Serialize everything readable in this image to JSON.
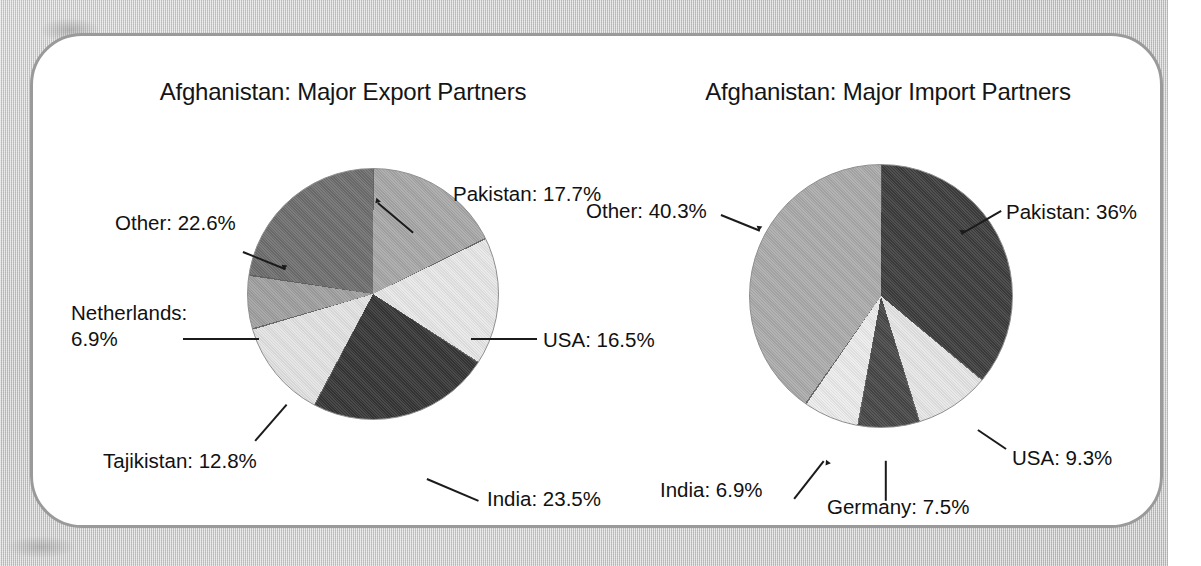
{
  "page": {
    "panel_border_color": "#9a9a9a",
    "background_color": "#c9c9c9"
  },
  "chart_data": [
    {
      "type": "pie",
      "id": "export",
      "title": "Afghanistan: Major Export Partners",
      "categories": [
        "Pakistan",
        "USA",
        "India",
        "Tajikistan",
        "Netherlands",
        "Other"
      ],
      "values": [
        17.7,
        16.5,
        23.5,
        12.8,
        6.9,
        22.6
      ],
      "labels": [
        "Pakistan: 17.7%",
        "USA: 16.5%",
        "India: 23.5%",
        "Tajikistan: 12.8%",
        "Netherlands: 6.9%",
        "Other: 22.6%"
      ],
      "colors": [
        "#a8a8a8",
        "#e8e8e8",
        "#363636",
        "#e3e3e3",
        "#a0a0a0",
        "#6e6e6e"
      ],
      "start_angle": 0,
      "direction": "clockwise",
      "legend": "none",
      "grid": false,
      "units": "percent"
    },
    {
      "type": "pie",
      "id": "import",
      "title": "Afghanistan: Major Import Partners",
      "categories": [
        "Pakistan",
        "USA",
        "Germany",
        "India",
        "Other"
      ],
      "values": [
        36,
        9.3,
        7.5,
        6.9,
        40.3
      ],
      "labels": [
        "Pakistan: 36%",
        "USA: 9.3%",
        "Germany: 7.5%",
        "India: 6.9%",
        "Other: 40.3%"
      ],
      "colors": [
        "#3d3d3d",
        "#e6e6e6",
        "#474747",
        "#ececec",
        "#ababab"
      ],
      "start_angle": 0,
      "direction": "clockwise",
      "legend": "none",
      "grid": false,
      "units": "percent"
    }
  ],
  "export_chart": {
    "title": "Afghanistan: Major Export Partners",
    "label_pakistan": "Pakistan: 17.7%",
    "label_usa": "USA: 16.5%",
    "label_india": "India: 23.5%",
    "label_tajikistan": "Tajikistan: 12.8%",
    "label_netherlands": "Netherlands: 6.9%",
    "label_other": "Other: 22.6%"
  },
  "import_chart": {
    "title": "Afghanistan: Major Import Partners",
    "label_pakistan": "Pakistan: 36%",
    "label_usa": "USA: 9.3%",
    "label_germany": "Germany: 7.5%",
    "label_india": "India: 6.9%",
    "label_other": "Other: 40.3%"
  }
}
